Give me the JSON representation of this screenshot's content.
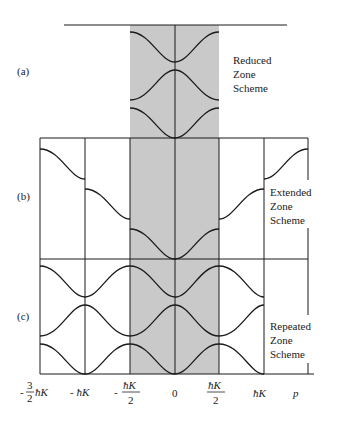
{
  "panels": [
    {
      "id": "a",
      "tag": "(a)",
      "scheme": [
        "Reduced",
        "Zone",
        "Scheme"
      ]
    },
    {
      "id": "b",
      "tag": "(b)",
      "scheme": [
        "Extended",
        "Zone",
        "Scheme"
      ]
    },
    {
      "id": "c",
      "tag": "(c)",
      "scheme": [
        "Repeated",
        "Zone",
        "Scheme"
      ]
    }
  ],
  "x_axis": {
    "ticks": [
      {
        "label": "-3/2 ħK",
        "num": "3",
        "den": "2",
        "sign": "-",
        "sym": "ħK"
      },
      {
        "label": "-ħK",
        "text": "- ħK"
      },
      {
        "label": "-ħK/2",
        "num": "ħK",
        "den": "2",
        "sign": "-"
      },
      {
        "label": "0",
        "text": "0"
      },
      {
        "label": "ħK/2",
        "num": "ħK",
        "den": "2"
      },
      {
        "label": "ħK",
        "text": "ħK"
      },
      {
        "label": "p",
        "text": "p"
      }
    ]
  },
  "colors": {
    "shade": "#c8c8c8",
    "line": "#1a1a1a"
  }
}
